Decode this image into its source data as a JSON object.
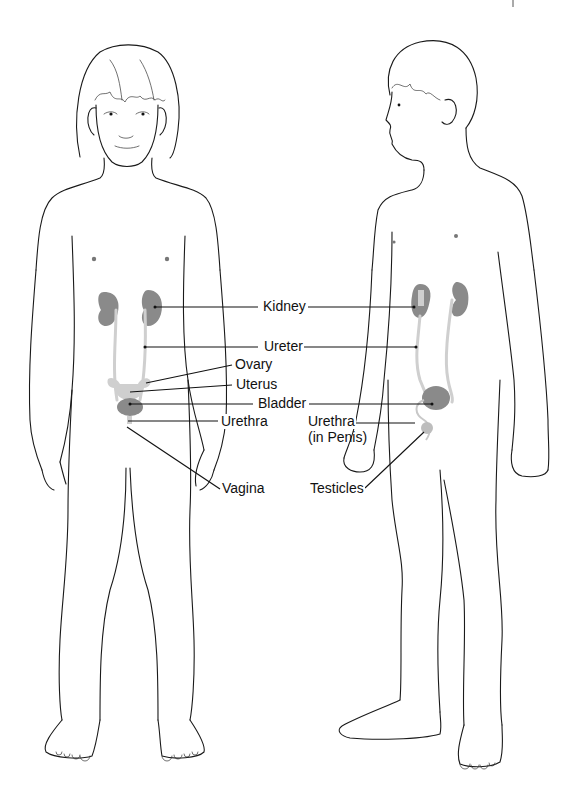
{
  "diagram": {
    "figures": [
      {
        "id": "girl",
        "view": "front"
      },
      {
        "id": "boy",
        "view": "three-quarter"
      }
    ],
    "labels": {
      "kidney": "Kidney",
      "ureter": "Ureter",
      "ovary": "Ovary",
      "uterus": "Uterus",
      "bladder": "Bladder",
      "urethra_girl": "Urethra",
      "urethra_boy_line1": "Urethra",
      "urethra_boy_line2": "(in Penis)",
      "vagina": "Vagina",
      "testicles": "Testicles"
    },
    "colors": {
      "outline": "#1a1a1a",
      "organ_dark": "#8a8a8a",
      "organ_light": "#cfcfcf",
      "background": "#ffffff"
    }
  }
}
